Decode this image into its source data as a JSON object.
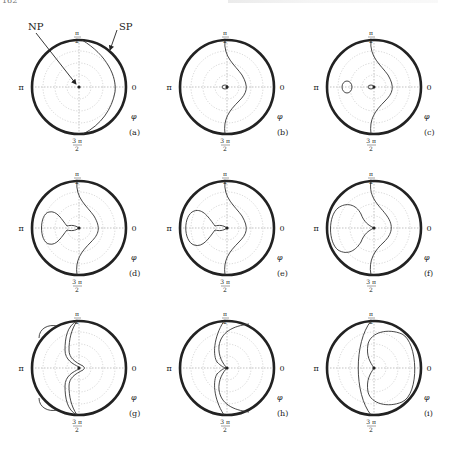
{
  "page": {
    "number": "162"
  },
  "figure": {
    "axis_labels": {
      "top_num": "π",
      "top_den": "2",
      "bottom_num": "3 π",
      "bottom_den": "2",
      "left": "π",
      "right": "0",
      "phi": "φ"
    },
    "annotations": {
      "np": "NP",
      "sp": "SP"
    },
    "panels": [
      {
        "id": "a",
        "label": "(a)"
      },
      {
        "id": "b",
        "label": "(b)"
      },
      {
        "id": "c",
        "label": "(c)"
      },
      {
        "id": "d",
        "label": "(d)"
      },
      {
        "id": "e",
        "label": "(e)"
      },
      {
        "id": "f",
        "label": "(f)"
      },
      {
        "id": "g",
        "label": "(g)"
      },
      {
        "id": "h",
        "label": "(h)"
      },
      {
        "id": "i",
        "label": "(i)"
      }
    ]
  },
  "colors": {
    "circle": "#222222",
    "curve": "#333333",
    "grid": "#bbbbbb"
  }
}
